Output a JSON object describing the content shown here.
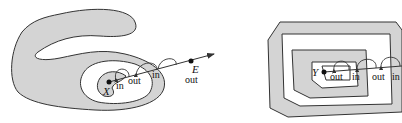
{
  "figures": [
    {
      "id": "left",
      "point_label": "X",
      "end_label": "E",
      "labels": [
        "in",
        "out",
        "in",
        "out"
      ]
    },
    {
      "id": "right",
      "point_label": "Y",
      "labels": [
        "out",
        "in",
        "out",
        "in"
      ]
    }
  ],
  "colors": {
    "region_fill": "#d4d4d4",
    "stroke": "#333333",
    "background": "#ffffff"
  }
}
